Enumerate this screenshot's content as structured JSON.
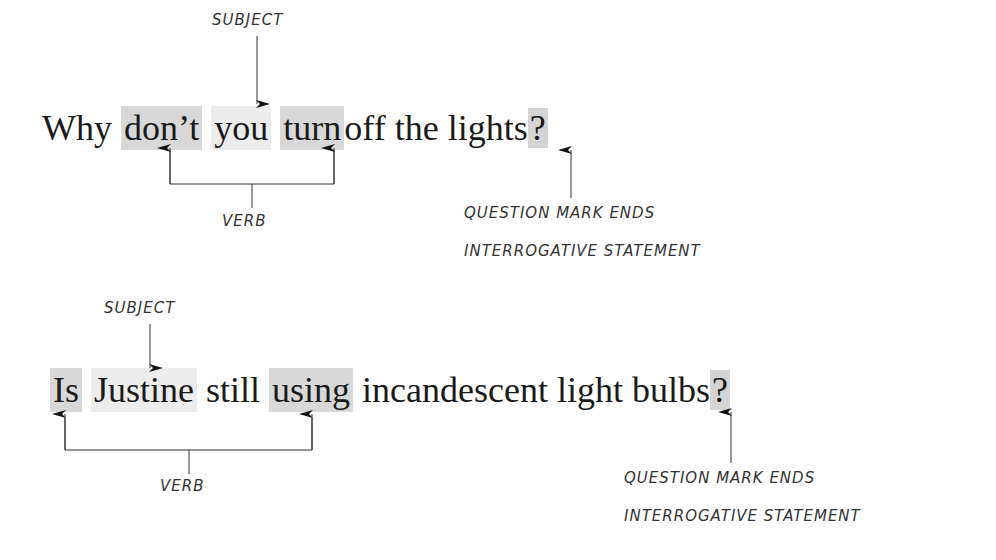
{
  "example1": {
    "words": [
      "Why",
      "don’t",
      "you",
      "turn",
      "off the lights",
      "?"
    ],
    "subject_label": "SUBJECT",
    "verb_label": "VERB",
    "question_label_line1": "QUESTION MARK ENDS",
    "question_label_line2": "INTERROGATIVE STATEMENT"
  },
  "example2": {
    "words": [
      "Is",
      "Justine",
      "still",
      "using",
      "incandescent light bulbs",
      "?"
    ],
    "subject_label": "SUBJECT",
    "verb_label": "VERB",
    "question_label_line1": "QUESTION MARK ENDS",
    "question_label_line2": "INTERROGATIVE STATEMENT"
  },
  "colors": {
    "verb_highlight": "#d8d8d8",
    "subject_highlight": "#ececec",
    "text": "#1a1a1a",
    "annotation": "#333333"
  }
}
